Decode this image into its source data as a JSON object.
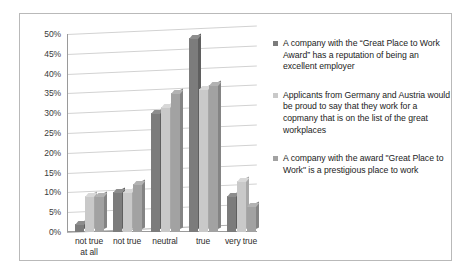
{
  "chart_data": {
    "type": "bar",
    "title": "",
    "xlabel": "",
    "ylabel": "",
    "ylim": [
      0,
      50
    ],
    "ytick_labels": [
      "50%",
      "45%",
      "40%",
      "35%",
      "30%",
      "25%",
      "20%",
      "15%",
      "10%",
      "5%",
      "0%"
    ],
    "ytick_values": [
      50,
      45,
      40,
      35,
      30,
      25,
      20,
      15,
      10,
      5,
      0
    ],
    "grid": true,
    "legend_position": "right",
    "categories": [
      "not true\nat all",
      "not true",
      "neutral",
      "true",
      "very true"
    ],
    "series": [
      {
        "name": "A company with the “Great Place to Work Award” has a reputation of being an excellent employer",
        "color": "#7c7c7c",
        "values": [
          2,
          10,
          30,
          49,
          9
        ]
      },
      {
        "name": "Applicants from Germany and Austria would be proud to say that they work for a copmany that is on the list of the great workplaces",
        "color": "#c9c9c9",
        "values": [
          9,
          10,
          31.5,
          36,
          13
        ]
      },
      {
        "name": "A company with the award \"Great Place to Work\" is a prestigious place to work",
        "color": "#a2a2a2",
        "values": [
          9,
          12,
          35,
          37,
          6.5
        ]
      }
    ]
  },
  "legend": {
    "entries": [
      "A company with the “Great Place to Work Award” has a reputation of being an excellent employer",
      "Applicants from Germany and Austria would be proud to say that they work for a copmany that is on the list of the great workplaces",
      "A company with the award \"Great Place to Work\" is a prestigious place to work"
    ]
  }
}
